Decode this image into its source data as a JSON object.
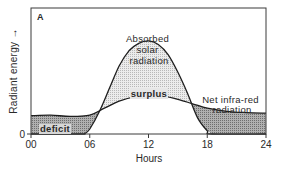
{
  "chart_data": {
    "type": "area",
    "panel_label": "A",
    "title": "",
    "xlabel": "Hours",
    "ylabel": "Radiant energy →",
    "x_ticks": [
      "00",
      "06",
      "12",
      "18",
      "24"
    ],
    "x_tick_values": [
      0,
      6,
      12,
      18,
      24
    ],
    "y_ticks": [
      "0"
    ],
    "xlim": [
      0,
      24
    ],
    "ylim": [
      0,
      10
    ],
    "grid": false,
    "series": [
      {
        "name": "Absorbed solar radiation",
        "x": [
          0,
          5,
          5.5,
          6,
          7,
          8,
          9,
          10,
          11,
          12,
          13,
          14,
          15,
          16,
          17,
          18,
          18.5,
          24
        ],
        "y": [
          0,
          0,
          0.05,
          0.4,
          1.8,
          3.6,
          5.4,
          6.6,
          7.2,
          7.4,
          7.1,
          6.3,
          4.9,
          3.2,
          1.3,
          0.25,
          0,
          0
        ]
      },
      {
        "name": "Net infra-red radiation",
        "x": [
          0,
          2,
          4,
          6,
          7.5,
          9,
          10.5,
          12,
          13.5,
          15,
          16.5,
          18,
          20,
          22,
          24
        ],
        "y": [
          1.45,
          1.5,
          1.4,
          1.5,
          2.05,
          2.6,
          2.95,
          3.1,
          3.0,
          2.75,
          2.4,
          2.05,
          1.8,
          1.7,
          1.65
        ]
      }
    ],
    "annotations": [
      {
        "text": "Absorbed\nsolar\nradiation",
        "lines": [
          "Absorbed",
          "solar",
          "radiation"
        ]
      },
      {
        "text": "surplus"
      },
      {
        "text": "Net infra-red\nradiation",
        "lines": [
          "Net infra-red",
          "radiation"
        ]
      },
      {
        "text": "deficit"
      }
    ],
    "colors": {
      "line": "#1e1e1e",
      "surplus_fill": "#d4d4d4",
      "deficit_fill": "#9c9c9c"
    }
  }
}
